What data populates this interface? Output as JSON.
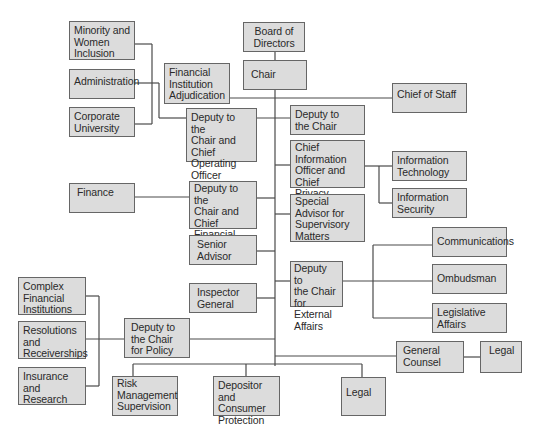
{
  "diagram": {
    "type": "org-chart",
    "line_color": "#4a4a4a",
    "box_fill": "#dcdcdc",
    "box_border": "#666666",
    "nodes": {
      "board": "Board of\nDirectors",
      "chair": "Chair",
      "minority": "Minority and\nWomen\nInclusion",
      "administration": "Administration",
      "corporate_university": "Corporate\nUniversity",
      "fin_inst_adjudication": "Financial\nInstitution\nAdjudication",
      "chief_of_staff": "Chief of Staff",
      "deputy_coo": "Deputy to the\nChair and\nChief Operating\nOfficer",
      "deputy_chair": "Deputy to\nthe Chair",
      "cio": "Chief\nInformation\nOfficer and Chief\nPrivacy Officer",
      "info_tech": "Information\nTechnology",
      "info_security": "Information\nSecurity",
      "finance": "Finance",
      "deputy_cfo": "Deputy to the\nChair and\nChief Financial\nOfficer",
      "special_advisor": "Special\nAdvisor for\nSupervisory\nMatters",
      "senior_advisor": "Senior\nAdvisor",
      "communications": "Communications",
      "ombudsman": "Ombudsman",
      "deputy_external": "Deputy to\nthe Chair\nfor External\nAffairs",
      "inspector_general": "Inspector\nGeneral",
      "legislative_affairs": "Legislative\nAffairs",
      "complex_financial": "Complex\nFinancial\nInstitutions",
      "resolutions": "Resolutions\nand\nReceiverships",
      "insurance": "Insurance and\nResearch",
      "deputy_policy": "Deputy to\nthe Chair\nfor Policy",
      "general_counsel": "General\nCounsel",
      "legal_gc": "Legal",
      "risk_management": "Risk\nManagement\nSupervision",
      "depositor": "Depositor and\nConsumer\nProtection",
      "legal_bottom": "Legal"
    },
    "edges": [
      [
        "board",
        "chair"
      ],
      [
        "chair",
        "fin_inst_adjudication"
      ],
      [
        "chair",
        "chief_of_staff"
      ],
      [
        "chair",
        "deputy_chair"
      ],
      [
        "chair",
        "deputy_coo"
      ],
      [
        "deputy_coo",
        "minority"
      ],
      [
        "deputy_coo",
        "administration"
      ],
      [
        "deputy_coo",
        "corporate_university"
      ],
      [
        "chair",
        "cio"
      ],
      [
        "cio",
        "info_tech"
      ],
      [
        "cio",
        "info_security"
      ],
      [
        "chair",
        "deputy_cfo"
      ],
      [
        "deputy_cfo",
        "finance"
      ],
      [
        "chair",
        "special_advisor"
      ],
      [
        "chair",
        "senior_advisor"
      ],
      [
        "chair",
        "deputy_external"
      ],
      [
        "deputy_external",
        "communications"
      ],
      [
        "deputy_external",
        "ombudsman"
      ],
      [
        "deputy_external",
        "legislative_affairs"
      ],
      [
        "chair",
        "inspector_general"
      ],
      [
        "chair",
        "deputy_policy"
      ],
      [
        "deputy_policy",
        "complex_financial"
      ],
      [
        "deputy_policy",
        "resolutions"
      ],
      [
        "deputy_policy",
        "insurance"
      ],
      [
        "chair",
        "general_counsel"
      ],
      [
        "general_counsel",
        "legal_gc"
      ],
      [
        "chair",
        "risk_management"
      ],
      [
        "chair",
        "depositor"
      ],
      [
        "chair",
        "legal_bottom"
      ]
    ]
  }
}
